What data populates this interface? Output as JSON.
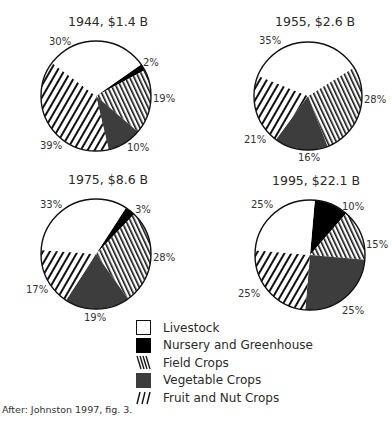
{
  "chart_data": {
    "type": "pie",
    "title": "",
    "categories": [
      "Livestock",
      "Nursery and Greenhouse",
      "Field Crops",
      "Vegetable Crops",
      "Fruit and Nut Crops"
    ],
    "pies": [
      {
        "title": "1944, $1.4 B",
        "year": 1944,
        "total": "$1.4 B",
        "values": {
          "Livestock": 30,
          "Nursery and Greenhouse": 2,
          "Field Crops": 19,
          "Vegetable Crops": 10,
          "Fruit and Nut Crops": 39
        }
      },
      {
        "title": "1955, $2.6 B",
        "year": 1955,
        "total": "$2.6 B",
        "values": {
          "Livestock": 35,
          "Nursery and Greenhouse": 0,
          "Field Crops": 28,
          "Vegetable Crops": 16,
          "Fruit and Nut Crops": 21
        }
      },
      {
        "title": "1975, $8.6 B",
        "year": 1975,
        "total": "$8.6 B",
        "values": {
          "Livestock": 33,
          "Nursery and Greenhouse": 3,
          "Field Crops": 28,
          "Vegetable Crops": 19,
          "Fruit and Nut Crops": 17
        }
      },
      {
        "title": "1995, $22.1 B",
        "year": 1995,
        "total": "$22.1 B",
        "values": {
          "Livestock": 25,
          "Nursery and Greenhouse": 10,
          "Field Crops": 15,
          "Vegetable Crops": 25,
          "Fruit and Nut Crops": 25
        }
      }
    ],
    "legend_position": "bottom-center",
    "source": "After: Johnston 1997, fig. 3."
  },
  "pies": [
    {
      "title": "1944, $1.4 B",
      "cx": 96,
      "cy": 96,
      "r": 55,
      "start": 55,
      "title_pos": [
        68,
        14
      ],
      "slices": [
        {
          "cat": "nursery",
          "pct": 2,
          "label": "2%",
          "lx": 143,
          "ly": 57
        },
        {
          "cat": "field",
          "pct": 19,
          "label": "19%",
          "lx": 153,
          "ly": 93
        },
        {
          "cat": "veg",
          "pct": 10,
          "label": "10%",
          "lx": 127,
          "ly": 142
        },
        {
          "cat": "fruit",
          "pct": 39,
          "label": "39%",
          "lx": 40,
          "ly": 140
        },
        {
          "cat": "livestock",
          "pct": 30,
          "label": "30%",
          "lx": 49,
          "ly": 36
        }
      ]
    },
    {
      "title": "1955, $2.6 B",
      "cx": 308,
      "cy": 96,
      "r": 54,
      "start": 58,
      "title_pos": [
        275,
        14
      ],
      "slices": [
        {
          "cat": "field",
          "pct": 28,
          "label": "28%",
          "lx": 364,
          "ly": 94
        },
        {
          "cat": "veg",
          "pct": 16,
          "label": "16%",
          "lx": 298,
          "ly": 152
        },
        {
          "cat": "fruit",
          "pct": 21,
          "label": "21%",
          "lx": 244,
          "ly": 134
        },
        {
          "cat": "livestock",
          "pct": 35,
          "label": "35%",
          "lx": 259,
          "ly": 35
        }
      ]
    },
    {
      "title": "1975, $8.6 B",
      "cx": 96,
      "cy": 254,
      "r": 55,
      "start": 33,
      "title_pos": [
        68,
        172
      ],
      "slices": [
        {
          "cat": "nursery",
          "pct": 3,
          "label": "3%",
          "lx": 135,
          "ly": 204
        },
        {
          "cat": "field",
          "pct": 28,
          "label": "28%",
          "lx": 153,
          "ly": 252
        },
        {
          "cat": "veg",
          "pct": 19,
          "label": "19%",
          "lx": 84,
          "ly": 312
        },
        {
          "cat": "fruit",
          "pct": 17,
          "label": "17%",
          "lx": 26,
          "ly": 284
        },
        {
          "cat": "livestock",
          "pct": 33,
          "label": "33%",
          "lx": 40,
          "ly": 199
        }
      ]
    },
    {
      "title": "1995, $22.1 B",
      "cx": 310,
      "cy": 255,
      "r": 55,
      "start": 5,
      "title_pos": [
        272,
        173
      ],
      "slices": [
        {
          "cat": "nursery",
          "pct": 10,
          "label": "10%",
          "lx": 342,
          "ly": 201
        },
        {
          "cat": "field",
          "pct": 15,
          "label": "15%",
          "lx": 366,
          "ly": 239
        },
        {
          "cat": "veg",
          "pct": 25,
          "label": "25%",
          "lx": 342,
          "ly": 305
        },
        {
          "cat": "fruit",
          "pct": 25,
          "label": "25%",
          "lx": 238,
          "ly": 288
        },
        {
          "cat": "livestock",
          "pct": 25,
          "label": "25%",
          "lx": 251,
          "ly": 199
        }
      ]
    }
  ],
  "legend": {
    "items": [
      {
        "cat": "livestock",
        "label": "Livestock"
      },
      {
        "cat": "nursery",
        "label": "Nursery and Greenhouse"
      },
      {
        "cat": "field",
        "label": "Field Crops"
      },
      {
        "cat": "veg",
        "label": "Vegetable Crops"
      },
      {
        "cat": "fruit",
        "label": "Fruit and Nut Crops"
      }
    ]
  },
  "colors": {
    "livestock": "#ffffff",
    "nursery": "#000000",
    "field_stripe": "#111111",
    "veg": "#3d3d3d",
    "fruit_stripe": "#111111",
    "outline": "#111111"
  },
  "source": "After: Johnston 1997, fig. 3."
}
